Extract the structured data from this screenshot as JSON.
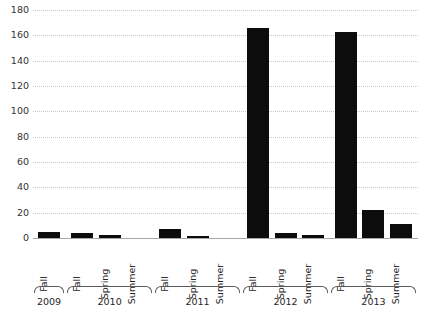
{
  "chart": {
    "title": "",
    "axis": {
      "y_label": "",
      "x_label": ""
    }
  },
  "chart_data": {
    "type": "bar",
    "title": "",
    "xlabel": "",
    "ylabel": "",
    "ylim": [
      0,
      180
    ],
    "yticks": [
      0,
      20,
      40,
      60,
      80,
      100,
      120,
      140,
      160,
      180
    ],
    "grid": true,
    "legend": "none",
    "bar_color": "#0c0c0c",
    "gridline_color": "#c9c9c9",
    "axis_color": "#a9a9a9",
    "categories": [
      "Fall",
      "Fall",
      "Spring",
      "Summer",
      "Fall",
      "Spring",
      "Summer",
      "Fall",
      "Spring",
      "Summer",
      "Fall",
      "Spring",
      "Summer"
    ],
    "values": [
      5,
      4,
      2,
      0,
      7,
      1.5,
      0,
      166,
      4,
      2,
      163,
      22,
      11
    ],
    "groups": [
      {
        "label": "2009",
        "terms": [
          "Fall"
        ],
        "values": [
          5
        ]
      },
      {
        "label": "2010",
        "terms": [
          "Fall",
          "Spring",
          "Summer"
        ],
        "values": [
          4,
          2,
          0
        ]
      },
      {
        "label": "2011",
        "terms": [
          "Fall",
          "Spring",
          "Summer"
        ],
        "values": [
          7,
          1.5,
          0
        ]
      },
      {
        "label": "2012",
        "terms": [
          "Fall",
          "Spring",
          "Summer"
        ],
        "values": [
          166,
          4,
          2
        ]
      },
      {
        "label": "2013",
        "terms": [
          "Fall",
          "Spring",
          "Summer"
        ],
        "values": [
          163,
          22,
          11
        ]
      }
    ]
  }
}
